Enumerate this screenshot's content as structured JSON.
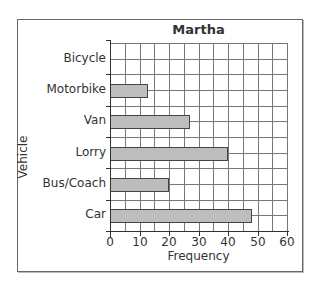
{
  "chart_data": {
    "type": "bar",
    "orientation": "horizontal",
    "title": "Martha",
    "xlabel": "Frequency",
    "ylabel": "Vehicle",
    "categories": [
      "Bicycle",
      "Motorbike",
      "Van",
      "Lorry",
      "Bus/Coach",
      "Car"
    ],
    "values": [
      0,
      13,
      27,
      40,
      20,
      48
    ],
    "xlim": [
      0,
      60
    ],
    "x_ticks": [
      0,
      10,
      20,
      30,
      40,
      50,
      60
    ],
    "grid": true,
    "grid_step": 5,
    "legend": null
  },
  "labels": {
    "title": "Martha",
    "xlabel": "Frequency",
    "ylabel": "Vehicle",
    "x_ticks": [
      "0",
      "10",
      "20",
      "30",
      "40",
      "50",
      "60"
    ],
    "categories": [
      "Bicycle",
      "Motorbike",
      "Van",
      "Lorry",
      "Bus/Coach",
      "Car"
    ]
  },
  "colors": {
    "bar_fill": "#bdbdbd",
    "bar_border": "#444444",
    "grid": "#777777"
  }
}
